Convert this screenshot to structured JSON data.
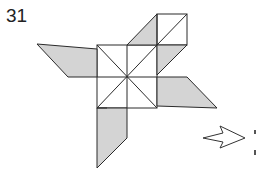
{
  "step": {
    "number": "31"
  },
  "diagram": {
    "shade_color": "#d4d4d4",
    "line_color": "#2a2a2a"
  },
  "next_arrow": {
    "icon": "right-arrow-icon"
  }
}
